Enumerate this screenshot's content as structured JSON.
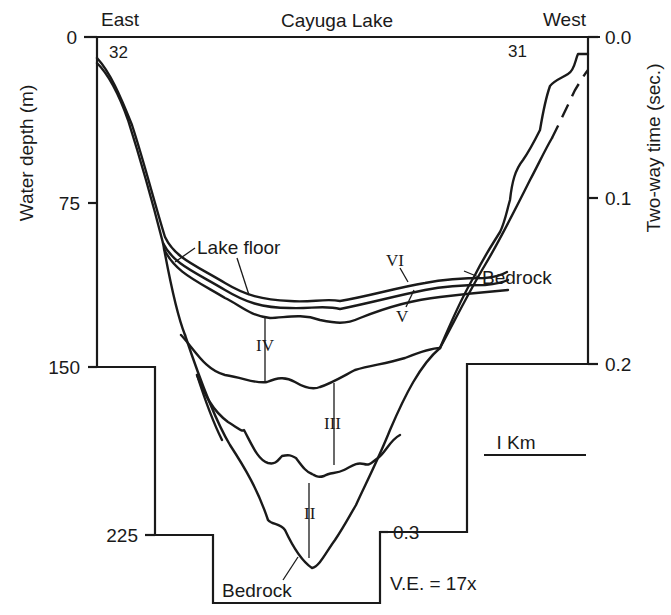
{
  "figure": {
    "title": "Cayuga Lake",
    "direction_left": "East",
    "direction_right": "West",
    "station_left": "32",
    "station_right": "31",
    "left_axis": {
      "label": "Water depth (m)",
      "ticks": [
        "0",
        "75",
        "150",
        "225"
      ]
    },
    "right_axis": {
      "label": "Two-way time (sec.)",
      "ticks": [
        "0.0",
        "0.1",
        "0.2",
        "0.3"
      ]
    },
    "labels": {
      "lake_floor": "Lake floor",
      "bedrock_right": "Bedrock",
      "bedrock_bottom": "Bedrock",
      "unit_ii": "II",
      "unit_iii": "III",
      "unit_iv": "IV",
      "unit_v": "V",
      "unit_vi": "VI"
    },
    "scale_bar": "I Km",
    "vertical_exaggeration": "V.E. = 17x"
  },
  "colors": {
    "ink": "#1a1a1a",
    "background": "#ffffff"
  }
}
